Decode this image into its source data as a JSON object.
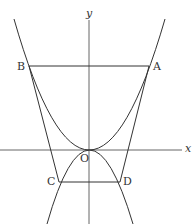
{
  "diagram": {
    "axes": {
      "x_label": "x",
      "y_label": "y"
    },
    "points": {
      "A": "A",
      "B": "B",
      "C": "C",
      "D": "D",
      "O": "O"
    },
    "curves": [
      {
        "name": "upward-parabola",
        "vertex": "O",
        "passes_through": [
          "A",
          "B"
        ]
      },
      {
        "name": "downward-parabola",
        "vertex": "O",
        "passes_through": [
          "C",
          "D"
        ]
      }
    ],
    "segments": [
      [
        "B",
        "A"
      ],
      [
        "C",
        "D"
      ]
    ],
    "lines": [
      [
        "B",
        "C"
      ],
      [
        "A",
        "D"
      ]
    ],
    "stroke_color": "#333333"
  }
}
